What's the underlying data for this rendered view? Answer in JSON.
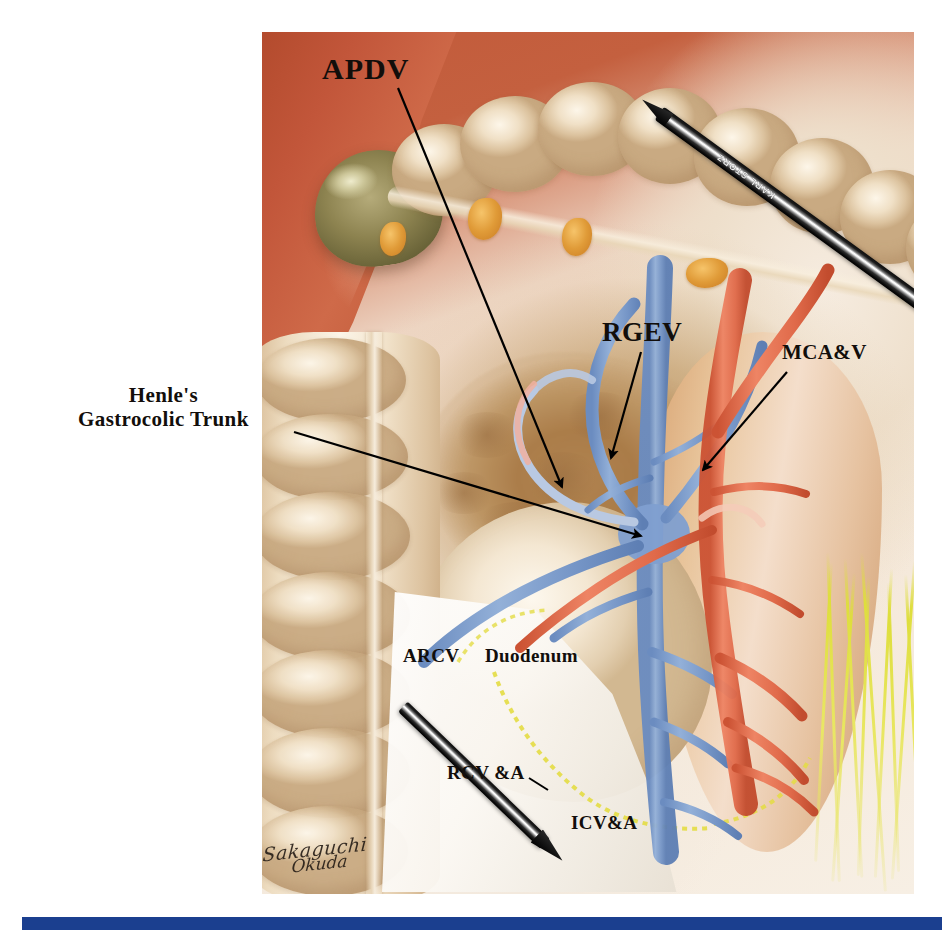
{
  "figure": {
    "type": "surgical-anatomical-illustration",
    "signature_line1": "Sakaguchi",
    "signature_line2": "Okuda"
  },
  "labels": [
    {
      "id": "apdv",
      "text": "APDV",
      "full_name": "Anterior superior pancreaticoduodenal vein",
      "x": 322,
      "y": 52
    },
    {
      "id": "henle",
      "line1": "Henle's",
      "line2": "Gastrocolic Trunk",
      "full_name": "Henle's gastrocolic trunk",
      "x": 78,
      "y": 384
    },
    {
      "id": "rgev",
      "text": "RGEV",
      "full_name": "Right gastroepiploic vein",
      "x": 602,
      "y": 317
    },
    {
      "id": "mcav",
      "text": "MCA&V",
      "full_name": "Middle colic artery and vein",
      "x": 782,
      "y": 341
    },
    {
      "id": "arcv",
      "text": "ARCV",
      "full_name": "Accessory right colic vein",
      "x": 403,
      "y": 645
    },
    {
      "id": "duodenum",
      "text": "Duodenum",
      "full_name": "Duodenum",
      "x": 485,
      "y": 645
    },
    {
      "id": "rcva",
      "text": "RCV &A",
      "full_name": "Right colic vein and artery",
      "x": 447,
      "y": 762
    },
    {
      "id": "icva",
      "text": "ICV&A",
      "full_name": "Ileocolic vein and artery",
      "x": 571,
      "y": 812
    }
  ],
  "instruments": [
    {
      "id": "laparoscopic-grasper-upper",
      "brand": "KARL STORZ",
      "position": "upper-right, entering from right"
    },
    {
      "id": "laparoscopic-grasper-lower",
      "brand": "",
      "position": "lower-left, entering from bottom"
    }
  ],
  "colors": {
    "vein_blue": "#7b9ccd",
    "artery_red": "#e06murkey",
    "artery_red_hex": "#e0664a",
    "nerve_yellow": "#dede3c",
    "fat_orange": "#e09b38",
    "gastric_wall_red": "#c2563a",
    "bottom_rule_blue": "#1b3f8f",
    "label_text": "#120e0b"
  },
  "bottom_rule": {
    "present": true,
    "color": "#1b3f8f"
  }
}
